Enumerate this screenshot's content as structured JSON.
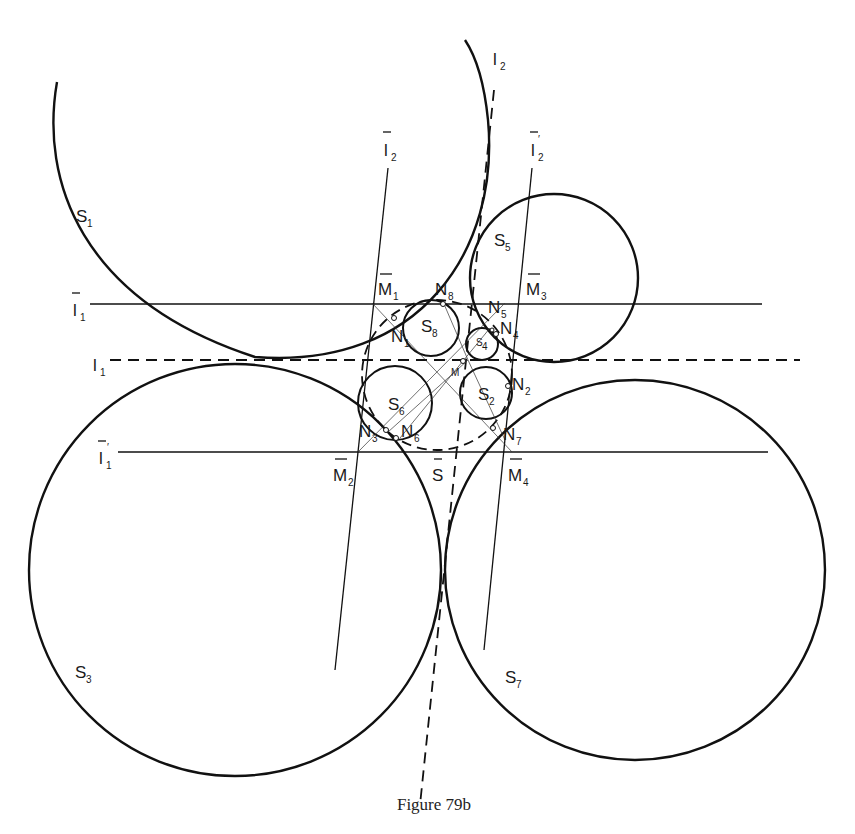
{
  "figure": {
    "caption": "Figure 79b",
    "type": "geometric construction of tangent circles (spheres) and lines"
  },
  "circles": [
    {
      "name": "S",
      "sub": "1"
    },
    {
      "name": "S",
      "sub": "2"
    },
    {
      "name": "S",
      "sub": "3"
    },
    {
      "name": "S",
      "sub": "4"
    },
    {
      "name": "S",
      "sub": "5"
    },
    {
      "name": "S",
      "sub": "6"
    },
    {
      "name": "S",
      "sub": "7"
    },
    {
      "name": "S",
      "sub": "8"
    }
  ],
  "lines": {
    "l1": {
      "name": "l",
      "sub": "1",
      "style": "dashed"
    },
    "l2": {
      "name": "l",
      "sub": "2",
      "style": "dashed"
    },
    "l1_bar": {
      "name": "l",
      "sub": "1",
      "overbar": true
    },
    "l1_bar_prime": {
      "name": "l",
      "sub": "1",
      "overbar": true,
      "prime": "′"
    },
    "l2_bar": {
      "name": "l",
      "sub": "2",
      "overbar": true
    },
    "l2_bar_prime": {
      "name": "l",
      "sub": "2",
      "overbar": true,
      "prime": "′"
    }
  },
  "points": {
    "M": {
      "name": "M"
    },
    "M1": {
      "name": "M",
      "sub": "1",
      "overbar": true
    },
    "M2": {
      "name": "M",
      "sub": "2",
      "overbar": true
    },
    "M3": {
      "name": "M",
      "sub": "3",
      "overbar": true
    },
    "M4": {
      "name": "M",
      "sub": "4",
      "overbar": true
    },
    "N1": {
      "name": "N",
      "sub": "1"
    },
    "N2": {
      "name": "N",
      "sub": "2"
    },
    "N3": {
      "name": "N",
      "sub": "3"
    },
    "N4": {
      "name": "N",
      "sub": "4"
    },
    "N5": {
      "name": "N",
      "sub": "5"
    },
    "N6": {
      "name": "N",
      "sub": "6"
    },
    "N7": {
      "name": "N",
      "sub": "7"
    },
    "N8": {
      "name": "N",
      "sub": "8"
    },
    "S_bar": {
      "name": "S",
      "overbar": true
    }
  }
}
